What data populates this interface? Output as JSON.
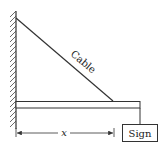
{
  "diagram": {
    "cable_label": "Cable",
    "sign_label": "Sign",
    "dimension_label": "x",
    "colors": {
      "stroke": "#333333",
      "background": "#ffffff"
    }
  }
}
